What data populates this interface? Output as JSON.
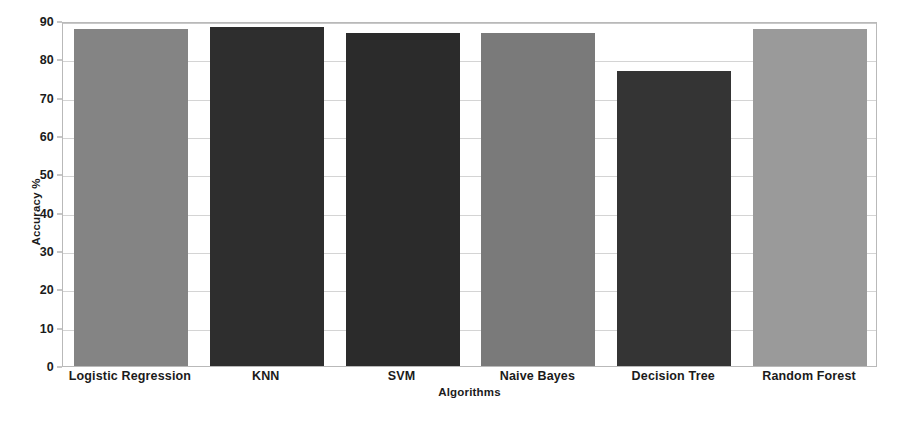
{
  "chart_data": {
    "type": "bar",
    "title": "",
    "xlabel": "Algorithms",
    "ylabel": "Accuracy %",
    "categories": [
      "Logistic Regression",
      "KNN",
      "SVM",
      "Naive Bayes",
      "Decision Tree",
      "Random Forest"
    ],
    "values": [
      88,
      88.5,
      87,
      87,
      77,
      88
    ],
    "ylim": [
      0,
      90
    ],
    "yticks": [
      0,
      10,
      20,
      30,
      40,
      50,
      60,
      70,
      80,
      90
    ],
    "ytick_labels": [
      "0",
      "10",
      "20",
      "30",
      "40",
      "50",
      "60",
      "70",
      "80",
      "90"
    ],
    "grid": true,
    "legend": "none",
    "bar_colors": [
      "#848484",
      "#2e2e2e",
      "#2b2b2b",
      "#7a7a7a",
      "#343434",
      "#9a9a9a"
    ]
  },
  "axes": {
    "y_title": "Accuracy %",
    "x_title": "Algorithms"
  }
}
